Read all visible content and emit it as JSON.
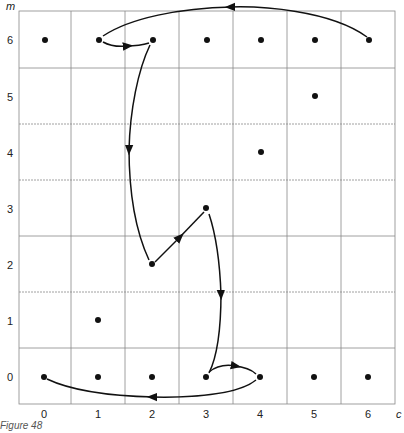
{
  "axes": {
    "x_name": "c",
    "y_name": "m",
    "x_ticks": [
      "0",
      "1",
      "2",
      "3",
      "4",
      "5",
      "6"
    ],
    "y_ticks": [
      "6",
      "5",
      "4",
      "3",
      "2",
      "1",
      "0"
    ]
  },
  "points": [
    {
      "c": 0,
      "m": 6
    },
    {
      "c": 1,
      "m": 6
    },
    {
      "c": 2,
      "m": 6
    },
    {
      "c": 3,
      "m": 6
    },
    {
      "c": 4,
      "m": 6
    },
    {
      "c": 5,
      "m": 6
    },
    {
      "c": 6,
      "m": 6
    },
    {
      "c": 5,
      "m": 5
    },
    {
      "c": 4,
      "m": 4
    },
    {
      "c": 3,
      "m": 3
    },
    {
      "c": 2,
      "m": 2
    },
    {
      "c": 1,
      "m": 1
    },
    {
      "c": 0,
      "m": 0
    },
    {
      "c": 1,
      "m": 0
    },
    {
      "c": 2,
      "m": 0
    },
    {
      "c": 3,
      "m": 0
    },
    {
      "c": 4,
      "m": 0
    },
    {
      "c": 5,
      "m": 0
    },
    {
      "c": 6,
      "m": 0
    }
  ],
  "arrows": [
    {
      "from": {
        "c": 0,
        "m": 0
      },
      "to": {
        "c": 4,
        "m": 0
      },
      "direction": "4→0"
    },
    {
      "from": {
        "c": 3,
        "m": 0
      },
      "to": {
        "c": 4,
        "m": 0
      }
    },
    {
      "from": {
        "c": 3,
        "m": 3
      },
      "to": {
        "c": 3,
        "m": 0
      }
    },
    {
      "from": {
        "c": 2,
        "m": 2
      },
      "to": {
        "c": 3,
        "m": 3
      }
    },
    {
      "from": {
        "c": 2,
        "m": 6
      },
      "to": {
        "c": 2,
        "m": 2
      }
    },
    {
      "from": {
        "c": 1,
        "m": 6
      },
      "to": {
        "c": 2,
        "m": 6
      }
    },
    {
      "from": {
        "c": 6,
        "m": 6
      },
      "to": {
        "c": 1,
        "m": 6
      }
    }
  ],
  "caption": "Figure 48"
}
